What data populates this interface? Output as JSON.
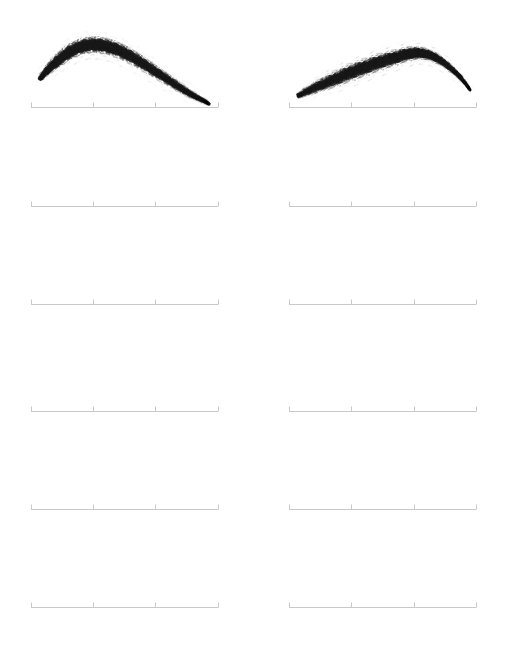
{
  "figure": {
    "title": "",
    "background_color": "#ffffff",
    "width": 507,
    "height": 651,
    "grid_rows": 6,
    "grid_cols": 2,
    "panel_count": 12,
    "filled_panel_count": 2,
    "empty_panel_count": 10,
    "axis_color": "#c9c9c9",
    "axis_line_width": 1,
    "tick_length": 5,
    "tick_direction": "up",
    "tick_count_per_axis": 4,
    "stroke_color": "#1a1a1a",
    "stroke_style": "stippled-brush",
    "columns": [
      {
        "name": "left-column",
        "x_start": 31,
        "x_end": 218
      },
      {
        "name": "right-column",
        "x_start": 289,
        "x_end": 476
      }
    ],
    "rows": [
      {
        "name": "row-1",
        "baseline_y": 107
      },
      {
        "name": "row-2",
        "baseline_y": 206
      },
      {
        "name": "row-3",
        "baseline_y": 304
      },
      {
        "name": "row-4",
        "baseline_y": 411
      },
      {
        "name": "row-5",
        "baseline_y": 509
      },
      {
        "name": "row-6",
        "baseline_y": 607
      }
    ],
    "axes": [
      {
        "id": "axis-r1c1",
        "name": "axis-row1-col1",
        "row": 1,
        "col": 1,
        "baseline_y": 107,
        "x_start": 31,
        "x_end": 218,
        "ticks": [
          31,
          93,
          155,
          218
        ],
        "has_stroke": true,
        "stroke_id": "brow-left"
      },
      {
        "id": "axis-r1c2",
        "name": "axis-row1-col2",
        "row": 1,
        "col": 2,
        "baseline_y": 107,
        "x_start": 289,
        "x_end": 476,
        "ticks": [
          289,
          351,
          414,
          476
        ],
        "has_stroke": true,
        "stroke_id": "brow-right"
      },
      {
        "id": "axis-r2c1",
        "name": "axis-row2-col1",
        "row": 2,
        "col": 1,
        "baseline_y": 206,
        "x_start": 31,
        "x_end": 218,
        "ticks": [
          31,
          93,
          155,
          218
        ],
        "has_stroke": false,
        "stroke_id": ""
      },
      {
        "id": "axis-r2c2",
        "name": "axis-row2-col2",
        "row": 2,
        "col": 2,
        "baseline_y": 206,
        "x_start": 289,
        "x_end": 476,
        "ticks": [
          289,
          351,
          414,
          476
        ],
        "has_stroke": false,
        "stroke_id": ""
      },
      {
        "id": "axis-r3c1",
        "name": "axis-row3-col1",
        "row": 3,
        "col": 1,
        "baseline_y": 304,
        "x_start": 31,
        "x_end": 218,
        "ticks": [
          31,
          93,
          155,
          218
        ],
        "has_stroke": false,
        "stroke_id": ""
      },
      {
        "id": "axis-r3c2",
        "name": "axis-row3-col2",
        "row": 3,
        "col": 2,
        "baseline_y": 304,
        "x_start": 289,
        "x_end": 476,
        "ticks": [
          289,
          351,
          414,
          476
        ],
        "has_stroke": false,
        "stroke_id": ""
      },
      {
        "id": "axis-r4c1",
        "name": "axis-row4-col1",
        "row": 4,
        "col": 1,
        "baseline_y": 411,
        "x_start": 31,
        "x_end": 218,
        "ticks": [
          31,
          93,
          155,
          218
        ],
        "has_stroke": false,
        "stroke_id": ""
      },
      {
        "id": "axis-r4c2",
        "name": "axis-row4-col2",
        "row": 4,
        "col": 2,
        "baseline_y": 411,
        "x_start": 289,
        "x_end": 476,
        "ticks": [
          289,
          351,
          414,
          476
        ],
        "has_stroke": false,
        "stroke_id": ""
      },
      {
        "id": "axis-r5c1",
        "name": "axis-row5-col1",
        "row": 5,
        "col": 1,
        "baseline_y": 509,
        "x_start": 31,
        "x_end": 218,
        "ticks": [
          31,
          93,
          155,
          218
        ],
        "has_stroke": false,
        "stroke_id": ""
      },
      {
        "id": "axis-r5c2",
        "name": "axis-row5-col2",
        "row": 5,
        "col": 2,
        "baseline_y": 509,
        "x_start": 289,
        "x_end": 476,
        "ticks": [
          289,
          351,
          414,
          476
        ],
        "has_stroke": false,
        "stroke_id": ""
      },
      {
        "id": "axis-r6c1",
        "name": "axis-row6-col1",
        "row": 6,
        "col": 1,
        "baseline_y": 607,
        "x_start": 31,
        "x_end": 218,
        "ticks": [
          31,
          93,
          155,
          218
        ],
        "has_stroke": false,
        "stroke_id": ""
      },
      {
        "id": "axis-r6c2",
        "name": "axis-row6-col2",
        "row": 6,
        "col": 2,
        "baseline_y": 607,
        "x_start": 289,
        "x_end": 476,
        "ticks": [
          289,
          351,
          414,
          476
        ],
        "has_stroke": false,
        "stroke_id": ""
      }
    ],
    "strokes": [
      {
        "id": "brow-left",
        "name": "eyebrow-stroke-left",
        "orientation": "arch-peak-left",
        "bbox": {
          "x": 38,
          "y": 38,
          "width": 172,
          "height": 68
        },
        "head_x": 40,
        "head_y": 78,
        "peak_x": 86,
        "peak_y": 44,
        "tail_x": 208,
        "tail_y": 104,
        "spine": [
          [
            40,
            79
          ],
          [
            48,
            70
          ],
          [
            58,
            61
          ],
          [
            70,
            52
          ],
          [
            84,
            46
          ],
          [
            98,
            45
          ],
          [
            112,
            48
          ],
          [
            126,
            54
          ],
          [
            140,
            62
          ],
          [
            154,
            71
          ],
          [
            168,
            80
          ],
          [
            182,
            89
          ],
          [
            194,
            96
          ],
          [
            204,
            101
          ],
          [
            209,
            104
          ]
        ],
        "thickness": [
          3.0,
          5.5,
          7.5,
          9.0,
          9.8,
          10.0,
          9.6,
          9.0,
          8.2,
          7.4,
          6.6,
          5.6,
          4.4,
          3.0,
          1.8
        ],
        "opacity": [
          0.35,
          0.7,
          0.92,
          1.0,
          1.0,
          0.98,
          0.94,
          0.88,
          0.8,
          0.72,
          0.62,
          0.5,
          0.38,
          0.24,
          0.12
        ]
      },
      {
        "id": "brow-right",
        "name": "eyebrow-stroke-right",
        "orientation": "arch-peak-right",
        "bbox": {
          "x": 296,
          "y": 44,
          "width": 176,
          "height": 56
        },
        "head_x": 298,
        "head_y": 96,
        "peak_x": 424,
        "peak_y": 52,
        "tail_x": 470,
        "tail_y": 90,
        "spine": [
          [
            298,
            96
          ],
          [
            310,
            90
          ],
          [
            324,
            84
          ],
          [
            338,
            78
          ],
          [
            352,
            72
          ],
          [
            366,
            67
          ],
          [
            380,
            62
          ],
          [
            394,
            58
          ],
          [
            408,
            54
          ],
          [
            420,
            53
          ],
          [
            432,
            56
          ],
          [
            444,
            63
          ],
          [
            456,
            73
          ],
          [
            465,
            83
          ],
          [
            470,
            90
          ]
        ],
        "thickness": [
          3.2,
          6.0,
          8.0,
          9.2,
          9.8,
          9.8,
          9.4,
          8.8,
          8.0,
          7.0,
          5.8,
          4.6,
          3.4,
          2.2,
          1.4
        ],
        "opacity": [
          0.28,
          0.5,
          0.66,
          0.78,
          0.86,
          0.92,
          0.96,
          1.0,
          1.0,
          0.96,
          0.86,
          0.7,
          0.52,
          0.34,
          0.16
        ]
      }
    ]
  }
}
